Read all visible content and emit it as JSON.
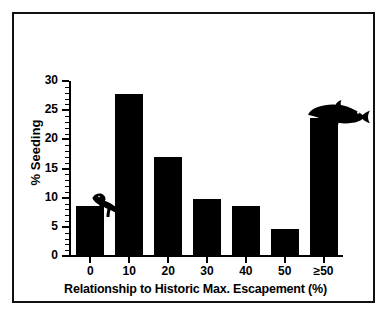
{
  "chart_data": {
    "type": "bar",
    "title": "",
    "xlabel": "Relationship to Historic Max. Escapement (%)",
    "ylabel": "% Seeding",
    "categories": [
      "0",
      "10",
      "20",
      "30",
      "40",
      "50",
      "≥50"
    ],
    "values": [
      8.6,
      27.8,
      16.9,
      9.8,
      8.5,
      4.7,
      23.6
    ],
    "ylim": [
      0,
      30
    ],
    "yticks": [
      0,
      5,
      10,
      15,
      20,
      25,
      30
    ],
    "ytick_labels": [
      "0",
      "5",
      "10",
      "15",
      "20",
      "25",
      "30"
    ],
    "y_minor_tick_interval": 1,
    "grid": false,
    "legend": null,
    "bar_color": "#000000",
    "annotations": [
      {
        "name": "dinosaur-icon",
        "category": "0",
        "description": "dinosaur silhouette above first bar"
      },
      {
        "name": "fish-icon",
        "category": "≥50",
        "description": "salmon silhouette above last bar"
      }
    ]
  },
  "figure": {
    "border_color": "#111111",
    "background": "#ffffff"
  }
}
